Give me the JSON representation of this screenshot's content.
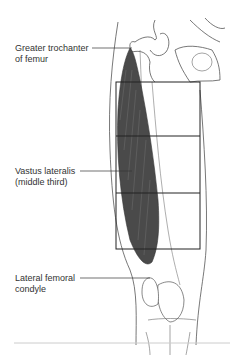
{
  "figure": {
    "type": "anatomical-diagram",
    "labels": [
      {
        "id": "greater-trochanter",
        "line1": "Greater trochanter",
        "line2": "of femur"
      },
      {
        "id": "vastus-lateralis",
        "line1": "Vastus lateralis",
        "line2": "(middle third)"
      },
      {
        "id": "lateral-femoral-condyle",
        "line1": "Lateral femoral",
        "line2": "condyle"
      }
    ],
    "grid": {
      "rows": 3,
      "note": "thigh divided into thirds; middle third highlighted"
    },
    "colors": {
      "muscle": "#4a4a4a",
      "line": "#222222",
      "outline": "#555555",
      "rule": "#cccccc"
    }
  }
}
